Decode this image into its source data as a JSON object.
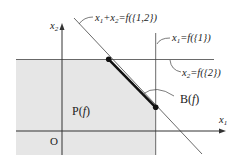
{
  "diagram": {
    "axes": {
      "x_label": "x",
      "x_sub": "1",
      "y_label": "x",
      "y_sub": "2",
      "origin_label": "O"
    },
    "region_label": "P(f)",
    "region_label_parts": {
      "main": "P(",
      "var": "f",
      "close": ")"
    },
    "base_label_parts": {
      "main": "B(",
      "var": "f",
      "close": ")"
    },
    "lines": [
      {
        "id": "sum",
        "label_parts": [
          "x",
          "1",
          "+x",
          "2",
          "=f({1,2})"
        ]
      },
      {
        "id": "x1",
        "label_parts": [
          "x",
          "1",
          "=f({1})"
        ]
      },
      {
        "id": "x2",
        "label_parts": [
          "x",
          "2",
          "=f({2})"
        ]
      }
    ],
    "colors": {
      "region_fill": "#e6e6e6",
      "line": "#333333",
      "segment": "#111111"
    }
  }
}
